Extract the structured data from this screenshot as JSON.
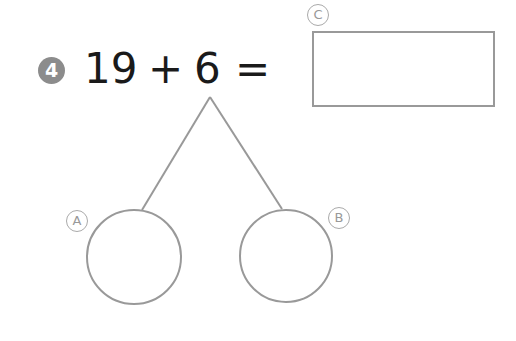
{
  "problem": {
    "number": "4",
    "first_addend": "19",
    "operator": "+",
    "second_addend": "6",
    "equals": "="
  },
  "labels": {
    "answer_box": "C",
    "left_circle": "A",
    "right_circle": "B"
  },
  "answer_box_value": "",
  "left_circle_value": "",
  "right_circle_value": "",
  "colors": {
    "badge": "#8c8c8c",
    "lines": "#999999",
    "text": "#1a1a1a"
  }
}
